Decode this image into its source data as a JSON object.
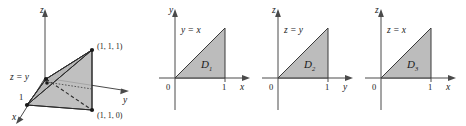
{
  "figure": {
    "background_color": "#ffffff",
    "ink_color": "#1a1a1a",
    "shade_color": "#b5b5b5",
    "axis_color": "#4a4a4a"
  },
  "panels": [
    {
      "id": "solid-region",
      "kind": "3d-tetrahedron",
      "axes": {
        "z_label": "z",
        "y_label": "y",
        "x_label": "x"
      },
      "labels": {
        "plane_label": "z = y",
        "x_intercept": "1",
        "vertex_top": "(1, 1, 1)",
        "vertex_bottom": "(1, 1, 0)"
      },
      "vertices": [
        {
          "name": "origin",
          "coord": "(0, 0, 0)"
        },
        {
          "name": "x-axis-point",
          "coord": "(1, 0, 0)"
        },
        {
          "name": "top-corner",
          "coord": "(1, 1, 1)"
        },
        {
          "name": "bottom-corner",
          "coord": "(1, 1, 0)"
        }
      ]
    },
    {
      "id": "D1",
      "kind": "2d-triangle",
      "axes": {
        "vertical_label": "y",
        "horizontal_label": "x"
      },
      "labels": {
        "origin": "0",
        "tick": "1",
        "boundary_line": "y = x",
        "region_name": "D",
        "region_subscript": "1"
      },
      "triangle_vertices": [
        [
          0,
          0
        ],
        [
          1,
          0
        ],
        [
          1,
          1
        ]
      ]
    },
    {
      "id": "D2",
      "kind": "2d-triangle",
      "axes": {
        "vertical_label": "z",
        "horizontal_label": "y"
      },
      "labels": {
        "origin": "0",
        "tick": "1",
        "boundary_line": "z = y",
        "region_name": "D",
        "region_subscript": "2"
      },
      "triangle_vertices": [
        [
          0,
          0
        ],
        [
          1,
          0
        ],
        [
          1,
          1
        ]
      ]
    },
    {
      "id": "D3",
      "kind": "2d-triangle",
      "axes": {
        "vertical_label": "z",
        "horizontal_label": "x"
      },
      "labels": {
        "origin": "0",
        "tick": "1",
        "boundary_line": "z = x",
        "region_name": "D",
        "region_subscript": "3"
      },
      "triangle_vertices": [
        [
          0,
          0
        ],
        [
          1,
          0
        ],
        [
          1,
          1
        ]
      ]
    }
  ]
}
